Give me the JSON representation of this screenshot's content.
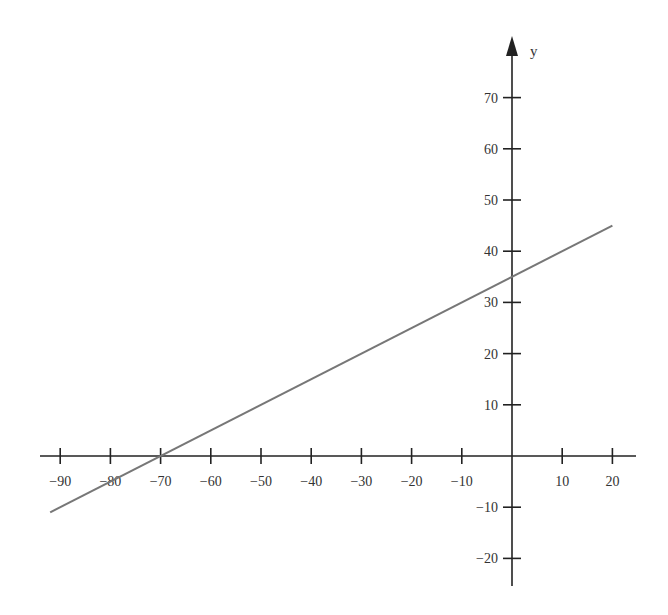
{
  "chart_data": {
    "type": "line",
    "title": "",
    "xlabel": "",
    "ylabel": "y",
    "xlim": [
      -92,
      22
    ],
    "ylim": [
      -22,
      76
    ],
    "grid": false,
    "legend": null,
    "x_ticks": [
      -90,
      -80,
      -70,
      -60,
      -50,
      -40,
      -30,
      -20,
      -10,
      10,
      20
    ],
    "x_tick_labels": [
      "−90",
      "−80",
      "−70",
      "−60",
      "−50",
      "−40",
      "−30",
      "−20",
      "−10",
      "10",
      "20"
    ],
    "y_ticks": [
      70,
      60,
      50,
      40,
      30,
      20,
      10,
      -10,
      -20
    ],
    "y_tick_labels": [
      "70",
      "60",
      "50",
      "40",
      "30",
      "20",
      "10",
      "−10",
      "−20"
    ],
    "series": [
      {
        "name": "y = 0.5x + 35",
        "equation": "y = 0.5x + 35",
        "slope": 0.5,
        "intercept": 35,
        "x": [
          -92,
          -70,
          0,
          20
        ],
        "values": [
          -11,
          0,
          35,
          45
        ],
        "color": "#777777"
      }
    ]
  },
  "colors": {
    "axis": "#222222",
    "line": "#777777",
    "text": "#333333",
    "background": "#ffffff"
  }
}
